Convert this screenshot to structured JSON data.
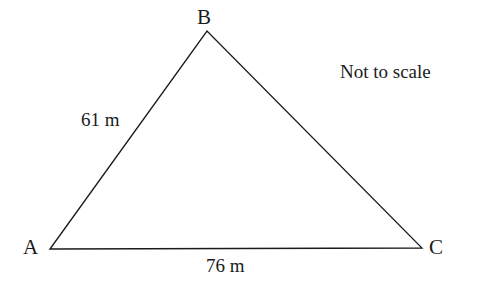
{
  "figure": {
    "kind": "geometry-diagram",
    "shape": "triangle",
    "background_color": "#ffffff",
    "stroke_color": "#1b1b1b",
    "stroke_width": 1.3,
    "width": 484,
    "height": 290,
    "note": "Not to scale"
  },
  "vertices": [
    {
      "name": "A",
      "label": "A",
      "x": 50,
      "y": 249
    },
    {
      "name": "B",
      "label": "B",
      "x": 207,
      "y": 31
    },
    {
      "name": "C",
      "label": "C",
      "x": 422,
      "y": 248
    }
  ],
  "sides": [
    {
      "name": "AB",
      "from": "A",
      "to": "B",
      "label": "61 m",
      "value": 61,
      "unit": "m"
    },
    {
      "name": "BC",
      "from": "B",
      "to": "C",
      "label": "",
      "value": null,
      "unit": "m"
    },
    {
      "name": "AC",
      "from": "A",
      "to": "C",
      "label": "76 m",
      "value": 76,
      "unit": "m"
    }
  ],
  "labels": {
    "vertex_a": "A",
    "vertex_b": "B",
    "vertex_c": "C",
    "side_ab": "61 m",
    "side_ac": "76 m",
    "not_to_scale": "Not to scale"
  },
  "geometry_path": "M 50 249 L 207 31 L 422 248 Z"
}
